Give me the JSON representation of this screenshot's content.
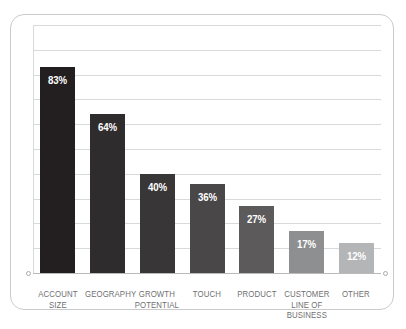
{
  "chart_data": {
    "type": "bar",
    "title": "",
    "subtitle": "",
    "xlabel": "",
    "ylabel": "",
    "ylim": [
      0,
      100
    ],
    "grid": true,
    "gridline_count": 10,
    "legend": "none",
    "orientation": "vertical",
    "value_label_position": "inside-top",
    "categories": [
      "ACCOUNT SIZE",
      "GEOGRAPHY",
      "GROWTH POTENTIAL",
      "TOUCH",
      "PRODUCT",
      "CUSTOMER LINE OF BUSINESS",
      "OTHER"
    ],
    "category_lines": [
      [
        "ACCOUNT",
        "SIZE"
      ],
      [
        "GEOGRAPHY"
      ],
      [
        "GROWTH",
        "POTENTIAL"
      ],
      [
        "TOUCH"
      ],
      [
        "PRODUCT"
      ],
      [
        "CUSTOMER",
        "LINE OF",
        "BUSINESS"
      ],
      [
        "OTHER"
      ]
    ],
    "values": [
      83,
      64,
      40,
      36,
      27,
      17,
      12
    ],
    "value_labels": [
      "83%",
      "64%",
      "40%",
      "36%",
      "27%",
      "17%",
      "12%"
    ],
    "bar_colors": [
      "#231f20",
      "#2f2c2d",
      "#393637",
      "#4a4748",
      "#5d5a5b",
      "#8e8f90",
      "#b4b5b6"
    ]
  },
  "style": {
    "frame_color": "#c9cacb",
    "gridline_color": "#d8d9da",
    "baseline_color": "#b9babb",
    "label_color": "#6f7072",
    "value_label_color": "#ffffff",
    "background": "#ffffff"
  }
}
